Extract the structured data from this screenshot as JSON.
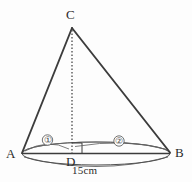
{
  "figure": {
    "shape_type": "cone",
    "stroke_color": "#3c3c3c",
    "background_color": "#fdfdfd",
    "vertices": {
      "apex_label": "C",
      "left_base_label": "A",
      "right_base_label": "B",
      "foot_label": "D"
    },
    "segments": {
      "left_arc_label": "①",
      "right_arc_label": "②"
    },
    "dimensions": {
      "base_diameter_label": "15cm"
    },
    "markers": {
      "right_angle_at_D": true,
      "height_line_style": "dotted"
    }
  }
}
